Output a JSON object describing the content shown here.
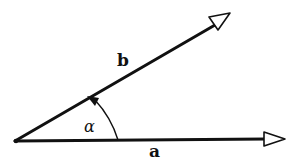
{
  "diagram": {
    "title": "",
    "vectors": [
      {
        "name": "a",
        "label": "a",
        "from": [
          15,
          141
        ],
        "to": [
          285,
          139
        ]
      },
      {
        "name": "b",
        "label": "b",
        "from": [
          15,
          141
        ],
        "to": [
          230,
          15
        ]
      }
    ],
    "angle": {
      "label": "α",
      "between": [
        "a",
        "b"
      ],
      "arc_radius": 103
    },
    "labels": {
      "a": "a",
      "b": "b",
      "alpha": "α"
    },
    "colors": {
      "stroke": "#111111",
      "background": "#ffffff"
    }
  }
}
